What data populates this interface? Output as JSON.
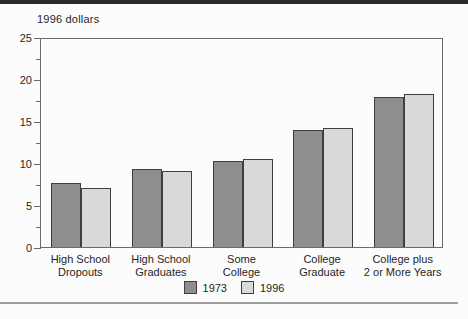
{
  "page": {
    "top_rule_color": "#2b2b2b",
    "bottom_rule_color": "#9e9e9e",
    "background": "#fcfcfc"
  },
  "chart_data": {
    "type": "bar",
    "title": "1996 dollars",
    "xlabel": "",
    "ylabel": "1996 dollars",
    "categories": [
      [
        "High School",
        "Dropouts"
      ],
      [
        "High School",
        "Graduates"
      ],
      [
        "Some",
        "College"
      ],
      [
        "College",
        "Graduate"
      ],
      [
        "College plus",
        "2 or More Years"
      ]
    ],
    "series": [
      {
        "name": "1973",
        "color": "#8e8e8e",
        "values": [
          7.6,
          9.3,
          10.2,
          13.9,
          17.9
        ]
      },
      {
        "name": "1996",
        "color": "#d9d9d9",
        "values": [
          7.0,
          9.0,
          10.5,
          14.2,
          18.2
        ]
      }
    ],
    "ylim": [
      0,
      25
    ],
    "y_ticks": [
      0,
      5,
      10,
      15,
      20,
      25
    ],
    "y_minor_tick_interval": 2.5,
    "grid": false,
    "legend_position": "bottom-center",
    "bar_border_color": "#3f3f3f",
    "axis_color": "#6b6b6b",
    "text_color": "#1f1f1f"
  }
}
